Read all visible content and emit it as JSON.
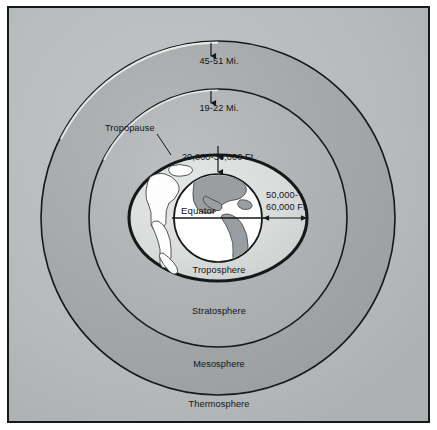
{
  "diagram": {
    "background_color": "#b9bcbd",
    "border_color": "#16181a"
  },
  "layers": [
    {
      "id": "thermosphere",
      "label": "Thermosphere",
      "color": "#b9bcbd",
      "order": 4
    },
    {
      "id": "mesosphere",
      "label": "Mesosphere",
      "color": "#a9acad",
      "order": 3
    },
    {
      "id": "stratosphere",
      "label": "Stratosphere",
      "color": "#b4b7b8",
      "order": 2
    },
    {
      "id": "troposphere",
      "label": "Troposphere",
      "color": "#dcdedd",
      "order": 1
    }
  ],
  "boundary": {
    "tropopause_label": "Tropopause"
  },
  "altitudes": [
    {
      "id": "mesopause-altitude",
      "text": "45-51 Mi.",
      "lines": [
        "45-51 Mi."
      ]
    },
    {
      "id": "stratopause-altitude",
      "text": "19-22 Mi.",
      "lines": [
        "19-22 Mi."
      ]
    },
    {
      "id": "tropopause-altitude-polar",
      "text": "20,000-30,000 Ft.",
      "lines": [
        "20,000-30,000 Ft."
      ]
    },
    {
      "id": "tropopause-altitude-equatorial",
      "text": "50,000-60,000 Ft.",
      "lines": [
        "50,000-",
        "60,000 Ft."
      ]
    }
  ],
  "globe": {
    "equator_label": "Equator",
    "ocean_color": "#ffffff",
    "land_color": "#9b9ea0",
    "outline_color": "#16181a"
  }
}
